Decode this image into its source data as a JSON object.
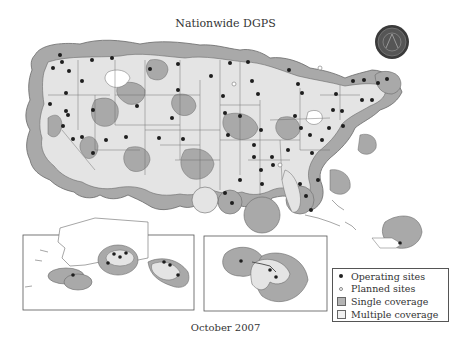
{
  "title": "Nationwide DGPS",
  "caption": "October 2007",
  "colors": {
    "single_coverage": "#a9a9a9",
    "multiple_coverage": "#e4e4e4",
    "boundary": "#6a6a6a",
    "operating_site": "#1e1e1e",
    "planned_site": "#ffffff",
    "background": "#ffffff"
  },
  "legend": {
    "items": [
      {
        "symbol": "filled-dot",
        "label": "Operating sites"
      },
      {
        "symbol": "open-dot",
        "label": "Planned sites"
      },
      {
        "symbol": "gray-square",
        "label": "Single coverage"
      },
      {
        "symbol": "light-square",
        "label": "Multiple coverage"
      }
    ]
  },
  "insets": [
    {
      "name": "Alaska"
    },
    {
      "name": "Hawaii"
    },
    {
      "name": "Puerto Rico"
    }
  ],
  "seal": {
    "icon": "agency-seal-icon"
  }
}
